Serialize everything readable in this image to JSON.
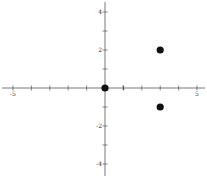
{
  "chart_data": {
    "type": "scatter",
    "title": "",
    "xlabel": "",
    "ylabel": "",
    "xlim": [
      -5.5,
      5.5
    ],
    "ylim": [
      -4.5,
      4.5
    ],
    "grid": false,
    "x_ticks": [
      -5,
      -4,
      -3,
      -2,
      -1,
      1,
      2,
      3,
      4,
      5
    ],
    "y_ticks": [
      -4,
      -3,
      -2,
      -1,
      1,
      2,
      3,
      4
    ],
    "x_tick_labels": [
      {
        "value": -5,
        "label": "-5"
      },
      {
        "value": 1,
        "label": "1"
      },
      {
        "value": 5,
        "label": "5"
      }
    ],
    "y_tick_labels": [
      {
        "value": 4,
        "label": "4"
      },
      {
        "value": 2,
        "label": "2"
      },
      {
        "value": -2,
        "label": "-2"
      },
      {
        "value": -4,
        "label": "-4"
      }
    ],
    "series": [
      {
        "name": "points",
        "x": [
          0,
          3,
          3
        ],
        "y": [
          0,
          2,
          -1
        ],
        "color": "#111111"
      }
    ]
  }
}
